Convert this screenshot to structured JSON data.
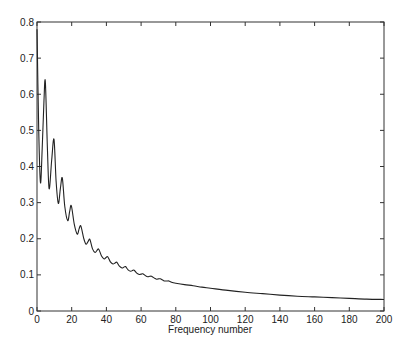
{
  "chart_data": {
    "type": "line",
    "title": "",
    "xlabel": "Frequency number",
    "ylabel": "",
    "xlim": [
      0,
      200
    ],
    "ylim": [
      0,
      0.8
    ],
    "xticks": [
      0,
      20,
      40,
      60,
      80,
      100,
      120,
      140,
      160,
      180,
      200
    ],
    "yticks": [
      0,
      0.1,
      0.2,
      0.3,
      0.4,
      0.5,
      0.6,
      0.7,
      0.8
    ],
    "xtick_labels": [
      "0",
      "20",
      "40",
      "60",
      "80",
      "100",
      "120",
      "140",
      "160",
      "180",
      "200"
    ],
    "ytick_labels": [
      "0",
      "0.1",
      "0.2",
      "0.3",
      "0.4",
      "0.5",
      "0.6",
      "0.7",
      "0.8"
    ],
    "grid": false,
    "legend": null,
    "series": [
      {
        "name": "spectrum",
        "color": "#222222",
        "x": [
          0,
          1,
          2,
          3,
          4,
          4.8,
          6,
          7,
          8.5,
          9.8,
          11,
          12.3,
          13.5,
          14.6,
          16,
          17.7,
          18.8,
          19.8,
          21.5,
          23.2,
          24.3,
          25.3,
          27,
          28.3,
          29.5,
          30.5,
          32,
          33.5,
          34.6,
          35.6,
          37.2,
          38.7,
          39.8,
          40.8,
          42.3,
          43.8,
          45,
          46,
          47.5,
          49,
          50,
          51,
          52.5,
          54,
          55,
          56,
          57.5,
          59,
          60,
          61,
          63,
          64,
          65,
          66,
          68,
          69,
          70,
          71,
          73,
          74,
          75,
          76,
          78,
          80,
          85,
          90,
          95,
          100,
          110,
          120,
          130,
          140,
          150,
          160,
          170,
          180,
          190,
          200
        ],
        "values": [
          0.78,
          0.5,
          0.355,
          0.45,
          0.58,
          0.635,
          0.45,
          0.338,
          0.42,
          0.475,
          0.36,
          0.298,
          0.34,
          0.368,
          0.29,
          0.25,
          0.275,
          0.291,
          0.24,
          0.213,
          0.228,
          0.235,
          0.2,
          0.185,
          0.193,
          0.198,
          0.172,
          0.162,
          0.168,
          0.171,
          0.152,
          0.144,
          0.148,
          0.15,
          0.136,
          0.13,
          0.133,
          0.135,
          0.124,
          0.119,
          0.121,
          0.123,
          0.114,
          0.11,
          0.112,
          0.113,
          0.105,
          0.101,
          0.102,
          0.103,
          0.096,
          0.095,
          0.096,
          0.096,
          0.09,
          0.088,
          0.089,
          0.089,
          0.084,
          0.083,
          0.083,
          0.083,
          0.079,
          0.077,
          0.073,
          0.07,
          0.066,
          0.063,
          0.057,
          0.052,
          0.048,
          0.044,
          0.041,
          0.039,
          0.037,
          0.035,
          0.033,
          0.032
        ]
      }
    ]
  }
}
